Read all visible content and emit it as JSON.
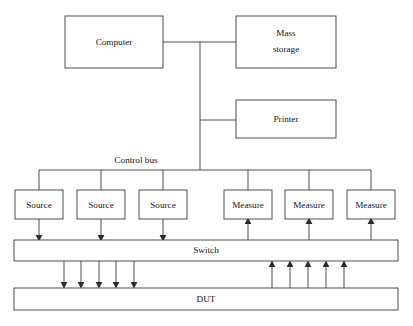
{
  "diagram": {
    "type": "block-diagram",
    "background_color": "#ffffff",
    "line_color": "#3a3a3a",
    "text_color": "#161616",
    "nodes": {
      "computer": {
        "label": "Computer"
      },
      "mass_storage": {
        "label_line1": "Mass",
        "label_line2": "storage"
      },
      "printer": {
        "label": "Printer"
      },
      "bus": {
        "label": "Control bus"
      },
      "source_1": {
        "label": "Source"
      },
      "source_2": {
        "label": "Source"
      },
      "source_3": {
        "label": "Source"
      },
      "measure_1": {
        "label": "Measure"
      },
      "measure_2": {
        "label": "Measure"
      },
      "measure_3": {
        "label": "Measure"
      },
      "switch": {
        "label": "Switch"
      },
      "dut": {
        "label": "DUT"
      }
    }
  }
}
